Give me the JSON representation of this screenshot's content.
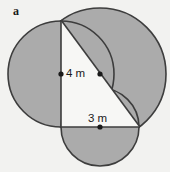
{
  "figure": {
    "part_label": "a",
    "background_color": "#f2f2f0",
    "shaded_fill_color": "#ababab",
    "unshaded_fill_color": "#f7f7f5",
    "outline_color": "#3d3d3d",
    "dot_color": "#1a1a1a",
    "labels": {
      "vertical_leg": "4 m",
      "horizontal_leg": "3 m"
    },
    "geometry": {
      "triangle_vertices": [
        {
          "name": "top",
          "x": 61,
          "y": 20
        },
        {
          "name": "right-angle",
          "x": 61,
          "y": 127
        },
        {
          "name": "right",
          "x": 140,
          "y": 127
        }
      ],
      "circles": [
        {
          "name": "left-circle-on-vertical-leg",
          "center_x": 61,
          "center_y": 74,
          "radius": 53,
          "shaded": true,
          "diameter_label": "4 m"
        },
        {
          "name": "upper-right-circle-on-hypotenuse",
          "center_x": 100,
          "center_y": 74,
          "radius": 66,
          "shaded": true,
          "diameter_label": ""
        },
        {
          "name": "bottom-circle-on-horizontal-leg",
          "center_x": 100,
          "center_y": 127,
          "radius": 39,
          "shaded": true,
          "diameter_label": "3 m"
        }
      ],
      "center_dots": [
        {
          "name": "left-circle-center-dot",
          "x": 61,
          "y": 74
        },
        {
          "name": "hypotenuse-circle-center-dot",
          "x": 100,
          "y": 74
        },
        {
          "name": "bottom-circle-center-dot",
          "x": 100,
          "y": 127
        }
      ]
    }
  }
}
